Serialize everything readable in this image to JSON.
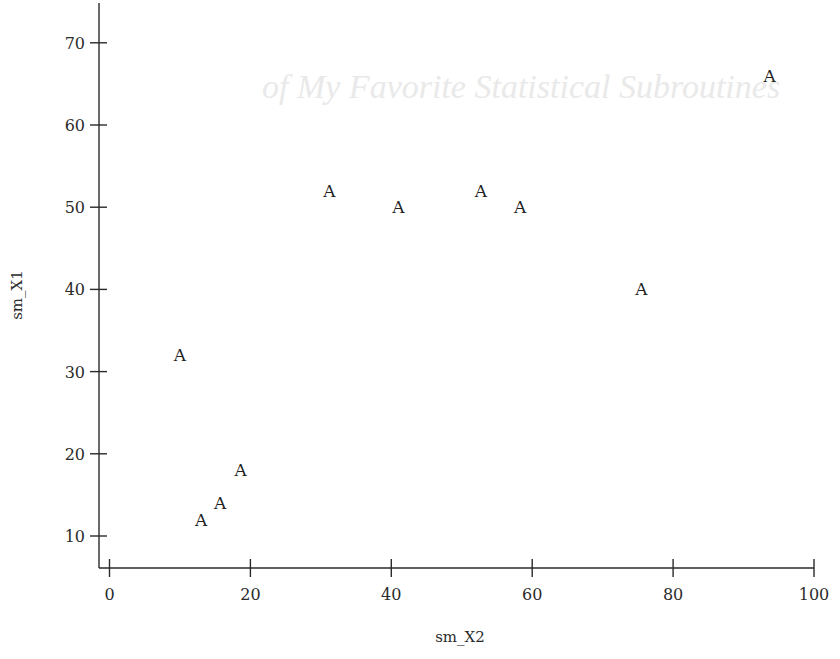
{
  "chart_data": {
    "type": "scatter",
    "title": "",
    "xlabel": "sm_X2",
    "ylabel": "sm_X1",
    "xlim": [
      0,
      100
    ],
    "ylim": [
      6,
      72
    ],
    "x_ticks": [
      0,
      20,
      40,
      60,
      80,
      100
    ],
    "y_ticks": [
      10,
      20,
      30,
      40,
      50,
      60,
      70
    ],
    "grid": false,
    "legend": null,
    "marker": "A",
    "series": [
      {
        "name": "A",
        "points": [
          {
            "x": 10,
            "y": 32
          },
          {
            "x": 13,
            "y": 12
          },
          {
            "x": 15.7,
            "y": 14
          },
          {
            "x": 18.6,
            "y": 18
          },
          {
            "x": 31.2,
            "y": 52
          },
          {
            "x": 41,
            "y": 50
          },
          {
            "x": 52.7,
            "y": 52
          },
          {
            "x": 58.3,
            "y": 50
          },
          {
            "x": 75.5,
            "y": 40
          },
          {
            "x": 93.7,
            "y": 66
          }
        ]
      }
    ]
  },
  "background": {
    "bleed_through_heading": "of My Favorite Statistical Subroutines"
  }
}
